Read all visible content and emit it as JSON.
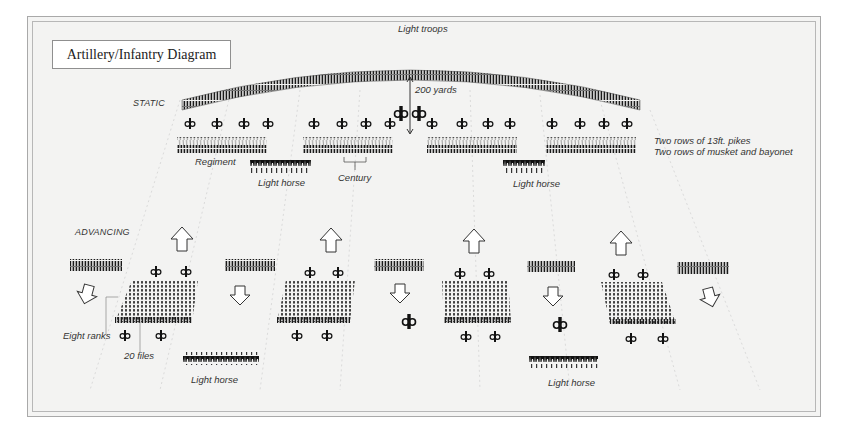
{
  "title": "Artillery/Infantry Diagram",
  "labels": {
    "light_troops": "Light troops",
    "static": "STATIC",
    "advancing": "ADVANCING",
    "distance": "200 yards",
    "regiment": "Regiment",
    "century": "Century",
    "light_horse_static_left": "Light horse",
    "light_horse_static_right": "Light horse",
    "light_horse_adv_left": "Light horse",
    "light_horse_adv_right": "Light horse",
    "eight_ranks": "Eight ranks",
    "twenty_files": "20 files"
  },
  "notes": {
    "line1": "Two rows of 13ft. pikes",
    "line2": "Two rows of musket and bayonet"
  },
  "formations": {
    "static": {
      "regiments": 4,
      "cannons_per_regiment": 4,
      "light_horse_units": 2,
      "central_cannons": 2
    },
    "advancing": {
      "blocks": 4,
      "ranks": 8,
      "files": 20,
      "skirmish_lines": 5,
      "up_arrows": 4,
      "down_arrows": 5,
      "light_horse_units": 2
    }
  },
  "colors": {
    "ink": "#1a1a1a",
    "background": "#f3f3f2",
    "frame": "#a9a9a9"
  }
}
